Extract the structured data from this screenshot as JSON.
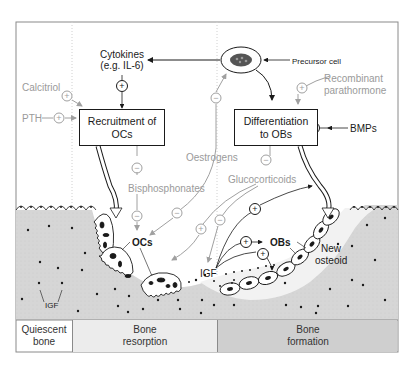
{
  "colors": {
    "frame": "#8a8a8a",
    "bone_fill": "#d9d9d9",
    "osteoid_fill": "#f2f2f2",
    "formation_band": "#cfcfcf",
    "resorption_band": "#ededed",
    "dark_text": "#1a1a1a",
    "grey_text": "#9a9a9a"
  },
  "nodes": {
    "precursor_cell": "Precursor cell",
    "cytokines_line1": "Cytokines",
    "cytokines_line2": "(e.g. IL-6)",
    "recruitment_box_line1": "Recruitment of",
    "recruitment_box_line2": "OCs",
    "differentiation_box_line1": "Differentiation",
    "differentiation_box_line2": "to OBs",
    "ocs": "OCs",
    "obs": "OBs",
    "new_osteoid_line1": "New",
    "new_osteoid_line2": "osteoid",
    "igf_center": "IGF",
    "igf_left": "IGF"
  },
  "regulators": {
    "calcitriol": {
      "label": "Calcitriol",
      "effect": "+"
    },
    "pth": {
      "label": "PTH",
      "effect": "+"
    },
    "recombinant_pth_line1": "Recombinant",
    "recombinant_pth_line2": "parathormone",
    "recombinant_pth_effect": "+",
    "bmps": {
      "label": "BMPs",
      "effect": "+"
    },
    "oestrogens": {
      "label": "Oestrogens",
      "effect": "−"
    },
    "bisphosphonates": {
      "label": "Bisphosphonates",
      "effect": "−"
    },
    "glucocorticoids": {
      "label": "Glucocorticoids",
      "effect": "−"
    }
  },
  "signs": {
    "plus": "+",
    "minus": "−"
  },
  "phases": [
    {
      "line1": "Quiescent",
      "line2": "bone"
    },
    {
      "line1": "Bone",
      "line2": "resorption"
    },
    {
      "line1": "Bone",
      "line2": "formation"
    }
  ]
}
